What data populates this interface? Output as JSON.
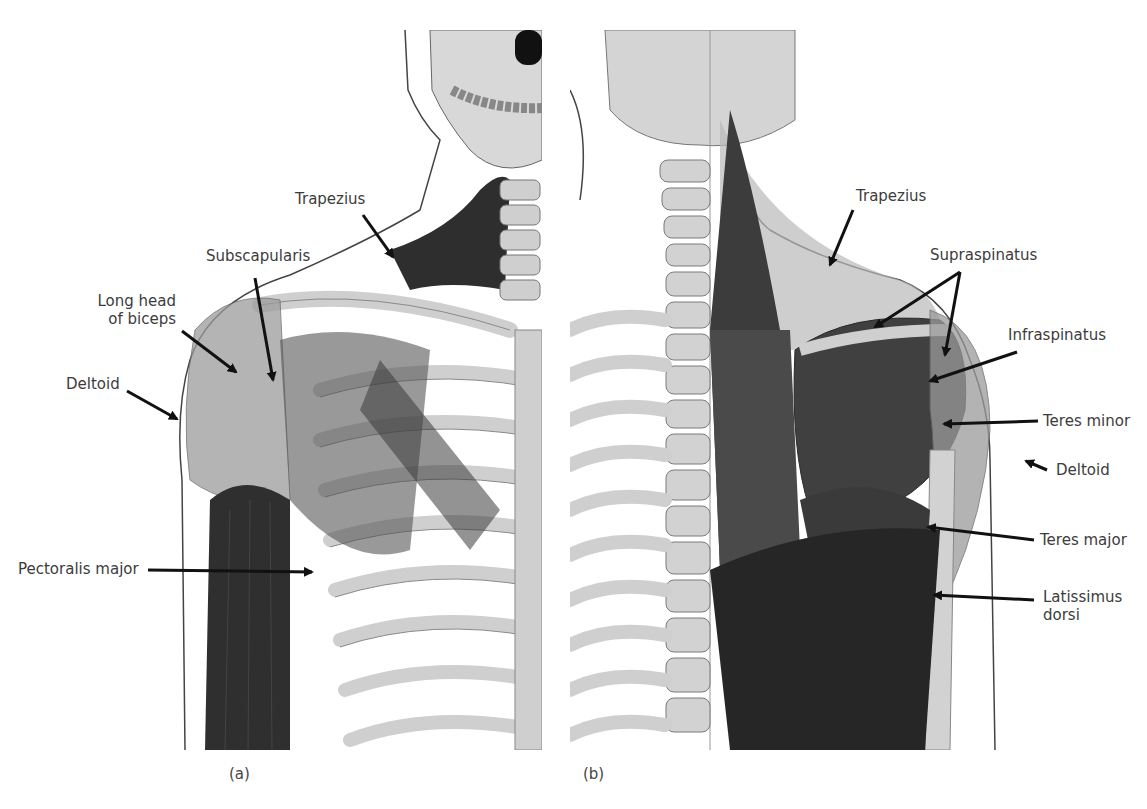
{
  "figure": {
    "panels": [
      {
        "id": "a",
        "caption": "(a)",
        "view": "anterior",
        "labels": [
          {
            "text": "Trapezius"
          },
          {
            "text": "Subscapularis"
          },
          {
            "text": "Long head of biceps",
            "lines": [
              "Long head",
              "of biceps"
            ]
          },
          {
            "text": "Deltoid"
          },
          {
            "text": "Pectoralis major"
          }
        ]
      },
      {
        "id": "b",
        "caption": "(b)",
        "view": "posterior",
        "labels": [
          {
            "text": "Trapezius"
          },
          {
            "text": "Supraspinatus"
          },
          {
            "text": "Infraspinatus"
          },
          {
            "text": "Teres minor"
          },
          {
            "text": "Deltoid"
          },
          {
            "text": "Teres major"
          },
          {
            "text": "Latissimus dorsi",
            "lines": [
              "Latissimus",
              "dorsi"
            ]
          }
        ]
      }
    ],
    "colors": {
      "background": "#ffffff",
      "bone": "#d9d9d9",
      "bone_shadow": "#a8a8a8",
      "muscle_dark": "#3a3a3a",
      "muscle_mid": "#6e6e6e",
      "muscle_light": "#b5b5b5",
      "outline": "#444444",
      "arrow": "#111111",
      "label_text": "#3c3c3c"
    }
  }
}
